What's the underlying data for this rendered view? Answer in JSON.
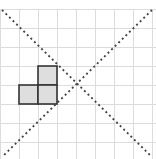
{
  "diagram": {
    "title": "",
    "grid": {
      "origin_x": 0,
      "origin_y": 9,
      "cell_size": 19,
      "cols": 8,
      "rows": 8,
      "line_color": "#dcdcdc"
    },
    "shape": {
      "name": "L-tromino",
      "fill": "#dedede",
      "stroke": "#333333",
      "cells": [
        {
          "col": 2,
          "row": 3
        },
        {
          "col": 1,
          "row": 4
        },
        {
          "col": 2,
          "row": 4
        }
      ]
    },
    "lines": [
      {
        "name": "diagonal-descending",
        "x1": 2,
        "y1": 10,
        "x2": 152,
        "y2": 157,
        "style": "dotted",
        "color": "#444444"
      },
      {
        "name": "diagonal-ascending",
        "x1": 152,
        "y1": 10,
        "x2": 2,
        "y2": 157,
        "style": "dotted",
        "color": "#444444"
      }
    ],
    "intersection": {
      "x": 76,
      "y": 85
    }
  }
}
